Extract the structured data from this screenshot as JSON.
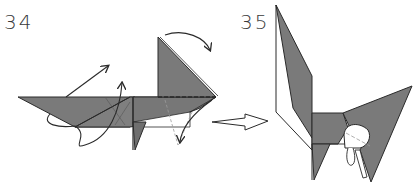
{
  "diagram": {
    "type": "origami-instructions",
    "steps": [
      {
        "number": "34",
        "description": "Side view: flat model with raised triangular flap; fold arrows indicate swinging flaps up and the top triangle over to the right"
      },
      {
        "number": "35",
        "description": "Result: figure with tall pointed ear/wing on left and wide triangle on right, small rounded detail below"
      }
    ],
    "transition_arrow": "hollow-right-arrow",
    "colors": {
      "paper_colored": "#7a7a7a",
      "paper_white": "#ffffff",
      "line": "#2a2a2a",
      "dashed": "#9a9a9a"
    }
  }
}
